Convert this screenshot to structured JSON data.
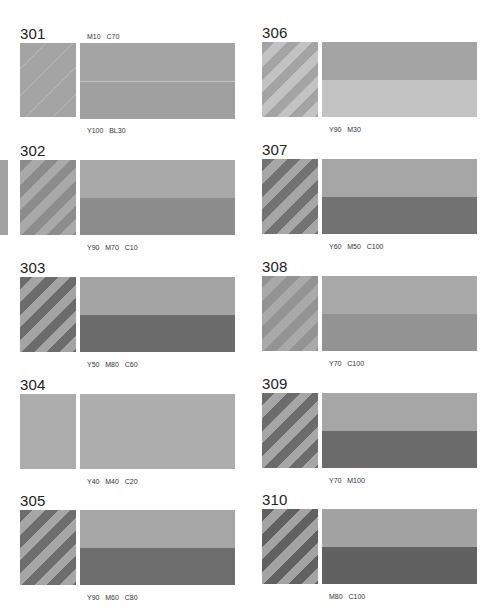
{
  "page": {
    "edge_sliver_color": "#a2a2a2",
    "swatches": [
      {
        "id": "301",
        "codes_top": "M10   C70",
        "codes_bottom": "Y100   BL30",
        "light": "#a4a4a4",
        "dark": "#a0a0a0",
        "stripes": false,
        "fine_lines": true
      },
      {
        "id": "302",
        "codes_bottom": "Y90   M70   C10",
        "light": "#a9a9a9",
        "dark": "#8c8c8c",
        "stripes": true
      },
      {
        "id": "303",
        "codes_bottom": "Y50   M80   C60",
        "light": "#a4a4a4",
        "dark": "#6c6c6c",
        "stripes": true
      },
      {
        "id": "304",
        "codes_bottom": "Y40   M40   C20",
        "light": "#adadad",
        "dark": "#adadad",
        "stripes": false
      },
      {
        "id": "305",
        "codes_bottom": "Y90   M60   C80",
        "light": "#a6a6a6",
        "dark": "#6e6e6e",
        "stripes": true
      },
      {
        "id": "306",
        "codes_bottom": "Y90   M30",
        "light": "#c3c3c3",
        "dark": "#a4a4a4",
        "stripes": true,
        "light_on_bottom": true
      },
      {
        "id": "307",
        "codes_bottom": "Y60   M50   C100",
        "light": "#a6a6a6",
        "dark": "#727272",
        "stripes": true
      },
      {
        "id": "308",
        "codes_bottom": "Y70   C100",
        "light": "#a9a9a9",
        "dark": "#939393",
        "stripes": true
      },
      {
        "id": "309",
        "codes_bottom": "Y70   M100",
        "light": "#a6a6a6",
        "dark": "#6c6c6c",
        "stripes": true
      },
      {
        "id": "310",
        "codes_bottom": "M80   C100",
        "light": "#a3a3a3",
        "dark": "#616161",
        "stripes": true
      }
    ]
  }
}
